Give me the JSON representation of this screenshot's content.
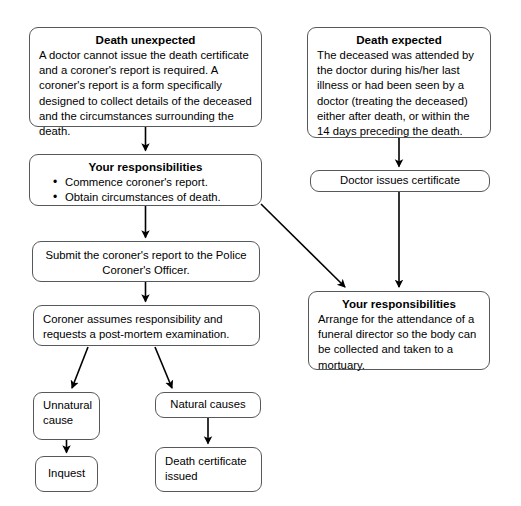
{
  "diagram": {
    "line_color": "#55595c",
    "arrow_color": "#000000",
    "background": "#ffffff"
  },
  "nodes": {
    "death_unexpected": {
      "title": "Death unexpected",
      "body": "A doctor cannot issue the death certificate and a coroner's report is required. A coroner's report is a form specifically designed to collect details of the deceased and the circumstances surrounding the death."
    },
    "death_expected": {
      "title": "Death expected",
      "body": "The deceased was attended by the doctor during his/her last illness or had been seen by a doctor (treating the deceased) either after death, or within the 14 days preceding the death."
    },
    "responsibilities_left": {
      "title": "Your responsibilities",
      "bullets": [
        "Commence coroner's report.",
        "Obtain circumstances of death."
      ]
    },
    "doctor_issues_certificate": {
      "body": "Doctor issues certificate"
    },
    "submit_report": {
      "body": "Submit the coroner's report to the Police Coroner's Officer."
    },
    "coroner_assumes": {
      "body": "Coroner assumes responsibility and requests a post-mortem examination."
    },
    "responsibilities_right": {
      "title": "Your responsibilities",
      "body": "Arrange for the attendance of a funeral director so the body can be collected and taken to a mortuary."
    },
    "unnatural_cause": {
      "body": "Unnatural cause"
    },
    "natural_causes": {
      "body": "Natural causes"
    },
    "inquest": {
      "body": "Inquest"
    },
    "death_certificate_issued": {
      "body": "Death certificate issued"
    }
  },
  "edges": [
    {
      "name": "death-unexpected-to-responsibilities-left",
      "from": "death_unexpected",
      "to": "responsibilities_left"
    },
    {
      "name": "death-expected-to-doctor-certificate",
      "from": "death_expected",
      "to": "doctor_issues_certificate"
    },
    {
      "name": "doctor-certificate-to-responsibilities-right",
      "from": "doctor_issues_certificate",
      "to": "responsibilities_right"
    },
    {
      "name": "responsibilities-left-to-submit-report",
      "from": "responsibilities_left",
      "to": "submit_report"
    },
    {
      "name": "responsibilities-left-to-responsibilities-right",
      "from": "responsibilities_left",
      "to": "responsibilities_right"
    },
    {
      "name": "submit-report-to-coroner-assumes",
      "from": "submit_report",
      "to": "coroner_assumes"
    },
    {
      "name": "coroner-assumes-to-unnatural-cause",
      "from": "coroner_assumes",
      "to": "unnatural_cause"
    },
    {
      "name": "coroner-assumes-to-natural-causes",
      "from": "coroner_assumes",
      "to": "natural_causes"
    },
    {
      "name": "unnatural-cause-to-inquest",
      "from": "unnatural_cause",
      "to": "inquest"
    },
    {
      "name": "natural-causes-to-death-certificate-issued",
      "from": "natural_causes",
      "to": "death_certificate_issued"
    }
  ]
}
